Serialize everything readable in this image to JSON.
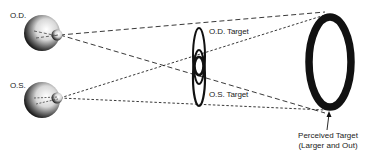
{
  "diagram": {
    "labels": {
      "od_eye": "O.D.",
      "os_eye": "O.S.",
      "od_target": "O.D. Target",
      "os_target": "O.S. Target",
      "perceived_line1": "Perceived Target",
      "perceived_line2": "(Larger and Out)"
    },
    "colors": {
      "ink": "#111111",
      "background": "#ffffff"
    }
  }
}
